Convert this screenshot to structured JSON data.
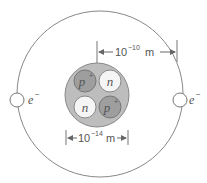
{
  "diagram": {
    "nucleus": {
      "particles": [
        {
          "symbol": "p",
          "charge": "+",
          "type": "proton"
        },
        {
          "symbol": "n",
          "charge": "",
          "type": "neutron"
        },
        {
          "symbol": "n",
          "charge": "",
          "type": "neutron"
        },
        {
          "symbol": "p",
          "charge": "+",
          "type": "proton"
        }
      ],
      "size_label": {
        "base": "10",
        "exponent": "−14",
        "unit": "m"
      }
    },
    "atom": {
      "size_label": {
        "base": "10",
        "exponent": "−10",
        "unit": "m"
      }
    },
    "electrons": [
      {
        "symbol": "e",
        "charge": "−"
      },
      {
        "symbol": "e",
        "charge": "−"
      }
    ],
    "colors": {
      "nucleus_fill": "#bdbdbd",
      "proton_fill": "#9e9e9e",
      "neutron_fill": "#f5f5f5",
      "stroke": "#777777"
    }
  }
}
